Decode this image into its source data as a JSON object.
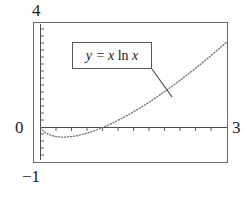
{
  "chart_data": {
    "type": "line",
    "title": "",
    "xlabel": "",
    "ylabel": "",
    "xlim": [
      0,
      3
    ],
    "ylim": [
      -1,
      4
    ],
    "grid": false,
    "legend_position": "inside-upper-left",
    "annotations": [
      {
        "name": "curve-label",
        "text": "y = x ln x",
        "parts": {
          "y": "y",
          "equals": "=",
          "x1": "x",
          "ln": "ln",
          "x2": "x"
        },
        "leader_line": {
          "from": [
            152,
            68
          ],
          "to": [
            172,
            96
          ]
        }
      }
    ],
    "tick_labels": {
      "y_top": "4",
      "y_bottom": "−1",
      "origin": "0",
      "x_right": "3"
    },
    "axis_ticks": {
      "x_interval": 0.25,
      "y_interval": 0.25
    },
    "series": [
      {
        "name": "y = x ln x",
        "style": "dotted",
        "color": "#6e6e6e",
        "x": [
          0,
          0.05,
          0.1,
          0.15,
          0.2,
          0.25,
          0.3,
          0.35,
          0.3679,
          0.4,
          0.45,
          0.5,
          0.55,
          0.6,
          0.65,
          0.7,
          0.75,
          0.8,
          0.85,
          0.9,
          0.95,
          1,
          1.1,
          1.2,
          1.3,
          1.4,
          1.5,
          1.6,
          1.7,
          1.8,
          1.9,
          2,
          2.1,
          2.2,
          2.3,
          2.4,
          2.5,
          2.6,
          2.7,
          2.8,
          2.9,
          3
        ],
        "y": [
          0,
          -0.15,
          -0.23,
          -0.28,
          -0.32,
          -0.35,
          -0.36,
          -0.37,
          -0.3679,
          -0.37,
          -0.36,
          -0.35,
          -0.33,
          -0.31,
          -0.28,
          -0.25,
          -0.22,
          -0.18,
          -0.14,
          -0.09,
          -0.05,
          0,
          0.1,
          0.22,
          0.34,
          0.47,
          0.61,
          0.75,
          0.9,
          1.06,
          1.22,
          1.39,
          1.56,
          1.73,
          1.92,
          2.1,
          2.29,
          2.48,
          2.68,
          2.88,
          3.09,
          3.3
        ]
      }
    ]
  },
  "colors": {
    "frame": "#6a6a6a",
    "axis": "#4a4a4a",
    "curve": "#6e6e6e",
    "text": "#1c1c1c",
    "background": "#ffffff"
  }
}
